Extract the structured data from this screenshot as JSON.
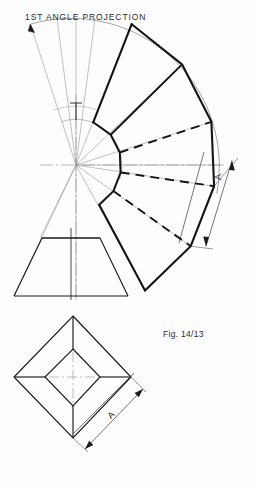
{
  "page": {
    "background": "#fdfdfd",
    "ink": "#1a1a1a",
    "thin_ink": "#555555",
    "width": 255,
    "height": 488
  },
  "title": {
    "text": "1ST ANGLE PROJECTION",
    "x": 25,
    "y": 12
  },
  "caption": {
    "text": "Fig. 14/13",
    "x": 163,
    "y": 329
  },
  "dimensions": [
    {
      "name": "development-dimension-a",
      "label": "A",
      "x": 219,
      "y": 176,
      "rotation": -90
    },
    {
      "name": "plan-dimension-a",
      "label": "A",
      "x": 112,
      "y": 414,
      "rotation": -45
    }
  ],
  "development": {
    "title": "radial development fan",
    "apex": {
      "x": 76,
      "y": 165
    },
    "outer_radius": 148,
    "inner_radius": 46,
    "start_angle_deg": -108,
    "end_angle_deg": 18,
    "segments": 6,
    "fold_line_styles": [
      "solid",
      "dashed",
      "solid",
      "dashed",
      "solid"
    ],
    "chords": [
      {
        "x1": 131.7,
        "y1": 24.2,
        "x2": 182.1,
        "y2": 64.4
      },
      {
        "x1": 182.1,
        "y1": 64.4,
        "x2": 211.4,
        "y2": 121.8
      },
      {
        "x1": 211.4,
        "y1": 121.8,
        "x2": 214.1,
        "y2": 186.2
      },
      {
        "x1": 214.1,
        "y1": 186.2,
        "x2": 190.7,
        "y2": 246.2
      },
      {
        "x1": 190.7,
        "y1": 246.2,
        "x2": 145.0,
        "y2": 290.4
      }
    ],
    "inner_chords": [
      {
        "x1": 93.2,
        "y1": 122.3,
        "x2": 110.7,
        "y2": 134.7
      },
      {
        "x1": 110.7,
        "y1": 134.7,
        "x2": 119.8,
        "y2": 152.5
      },
      {
        "x1": 119.8,
        "y1": 152.5,
        "x2": 120.6,
        "y2": 172.5
      },
      {
        "x1": 120.6,
        "y1": 172.5,
        "x2": 113.4,
        "y2": 191.1
      },
      {
        "x1": 113.4,
        "y1": 191.1,
        "x2": 99.2,
        "y2": 204.8
      }
    ]
  },
  "front_view": {
    "title": "front elevation trapezoid",
    "bottom_left": {
      "x": 14,
      "y": 296
    },
    "bottom_right": {
      "x": 128,
      "y": 296
    },
    "top_left": {
      "x": 42,
      "y": 238
    },
    "top_right": {
      "x": 100,
      "y": 238
    },
    "centerline_x": 71
  },
  "plan_view": {
    "title": "plan view diamond",
    "outer": {
      "top": {
        "x": 73,
        "y": 316
      },
      "right": {
        "x": 131,
        "y": 377
      },
      "bottom": {
        "x": 73,
        "y": 438
      },
      "left": {
        "x": 14,
        "y": 377
      }
    },
    "inner": {
      "top": {
        "x": 73,
        "y": 349
      },
      "right": {
        "x": 100,
        "y": 377
      },
      "bottom": {
        "x": 73,
        "y": 406
      },
      "left": {
        "x": 45,
        "y": 377
      }
    }
  },
  "icons": {
    "arrowhead": "arrowhead-icon",
    "centerline": "centerline-icon"
  }
}
